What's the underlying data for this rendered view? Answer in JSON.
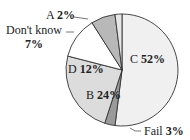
{
  "chart_data": {
    "type": "pie",
    "title": "",
    "start_angle_deg": 0,
    "direction": "clockwise",
    "slices": [
      {
        "label": "C",
        "value": 52,
        "display": "52%",
        "color": "#f0f0f0"
      },
      {
        "label": "Fail",
        "value": 3,
        "display": "3%",
        "color": "#9a9a9a"
      },
      {
        "label": "B",
        "value": 24,
        "display": "24%",
        "color": "#dcdcdc"
      },
      {
        "label": "D",
        "value": 12,
        "display": "12%",
        "color": "#ffffff"
      },
      {
        "label": "Don't know",
        "value": 7,
        "display": "7%",
        "color": "#b8b8b8"
      },
      {
        "label": "A",
        "value": 2,
        "display": "2%",
        "color": "#e6e6e6"
      }
    ]
  },
  "labels": {
    "c": {
      "name": "C",
      "pct": "52%"
    },
    "b": {
      "name": "B",
      "pct": "24%"
    },
    "d": {
      "name": "D",
      "pct": "12%"
    },
    "a": {
      "name": "A",
      "pct": "2%"
    },
    "dk": {
      "name": "Don't know",
      "pct": "7%"
    },
    "fail": {
      "name": "Fail",
      "pct": "3%"
    }
  }
}
